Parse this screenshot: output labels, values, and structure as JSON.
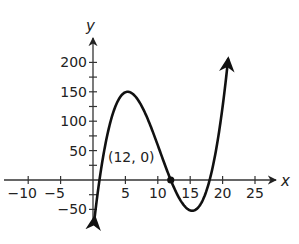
{
  "chart_data": {
    "type": "line",
    "title": "",
    "xlabel": "x",
    "ylabel": "y",
    "xlim": [
      -14,
      28
    ],
    "ylim": [
      -75,
      235
    ],
    "grid": false,
    "x_ticks": [
      -10,
      -5,
      5,
      10,
      15,
      20,
      25
    ],
    "x_tick_labels": [
      "−10",
      "−5",
      "5",
      "10",
      "15",
      "20",
      "25"
    ],
    "y_ticks": [
      -50,
      50,
      100,
      150,
      200
    ],
    "y_tick_labels": [
      "−50",
      "50",
      "100",
      "150",
      "200"
    ],
    "y_minor_step": 25,
    "series": [
      {
        "name": "polynomial curve",
        "function": "y = 0.41(x - 1)(x - 12)(x - 18)",
        "x": [
          0.3,
          1,
          2,
          3,
          4,
          5,
          5.5,
          6,
          7,
          8,
          9,
          10,
          11,
          12,
          13,
          14,
          15,
          15.5,
          16,
          17,
          18,
          19,
          20,
          20.9
        ],
        "values": [
          -72,
          0,
          72,
          117,
          143,
          152,
          150,
          148,
          135,
          115,
          86,
          57,
          28,
          0,
          -22,
          -44,
          -52,
          -52,
          -49,
          -33,
          0,
          50,
          119,
          200
        ],
        "end_arrows": true
      }
    ],
    "points": [
      {
        "x": 12,
        "y": 0,
        "label": "(12, 0)"
      }
    ]
  },
  "labels": {
    "x_axis": "x",
    "y_axis": "y",
    "point_annotation": "(12, 0)"
  },
  "colors": {
    "curve": "#111111",
    "axis": "#333333",
    "text": "#222222"
  }
}
